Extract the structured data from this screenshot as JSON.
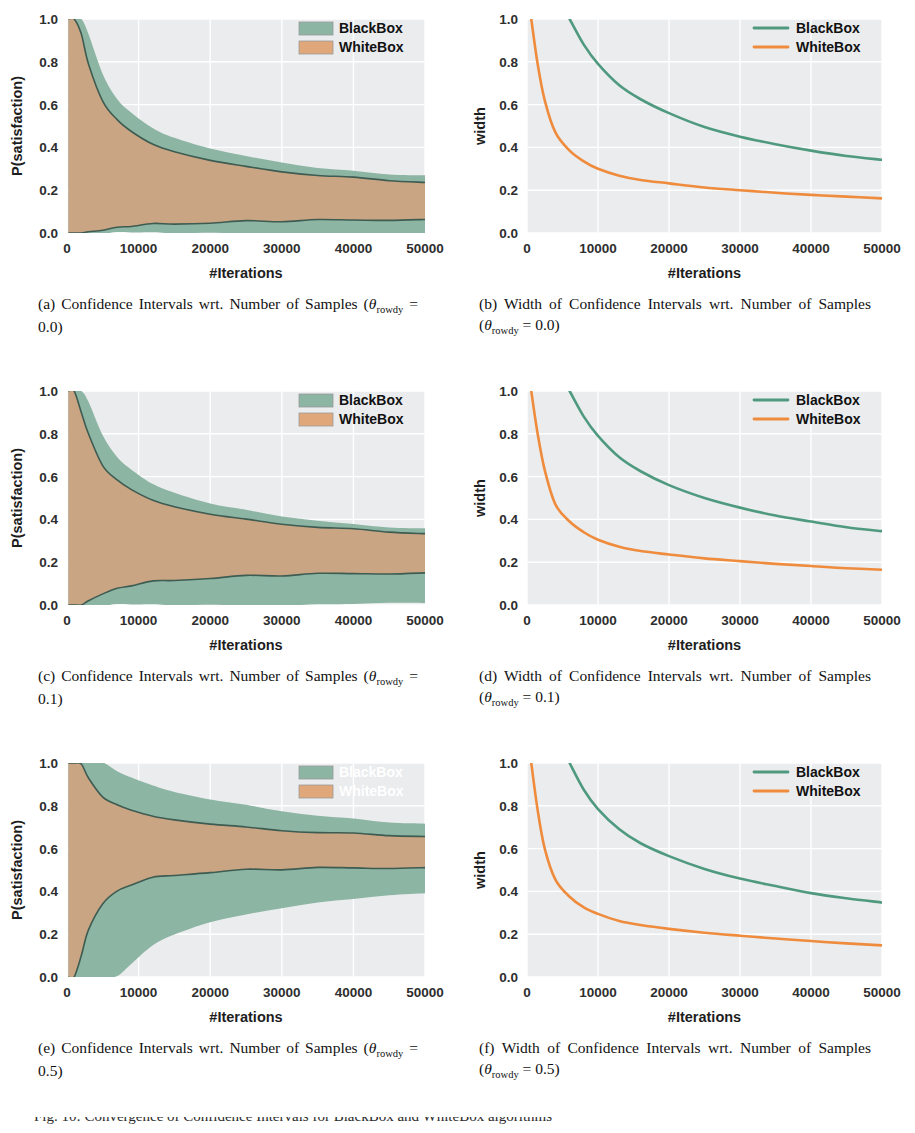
{
  "figure": {
    "panel_count": 6,
    "bottom_cut_text": "Fig. 10: Convergence of Confidence Intervals for BlackBox and WhiteBox algorithms"
  },
  "series_colors": {
    "blackbox_fill": "#8cb5a3",
    "blackbox_line": "#4f9a7f",
    "whitebox_fill": "#e0a87a",
    "whitebox_line": "#ef8b3c",
    "overlap_fill": "#c9a583",
    "edge_line": "#3e5c52",
    "plot_bg": "#eaecee",
    "grid": "#ffffff"
  },
  "labels": {
    "blackbox": "BlackBox",
    "whitebox": "WhiteBox",
    "xlabel": "#Iterations",
    "ylabel_left": "P(satisfaction)",
    "ylabel_right": "width",
    "xticks": [
      "0",
      "10000",
      "20000",
      "30000",
      "40000",
      "50000"
    ],
    "yticks": [
      "0.0",
      "0.2",
      "0.4",
      "0.6",
      "0.8",
      "1.0"
    ]
  },
  "captions": {
    "a": {
      "tag": "(a)",
      "text_before": "Confidence Intervals wrt. Number of Samples (",
      "theta": "θ",
      "sub": "rowdy",
      "eq": " = 0.0)"
    },
    "b": {
      "tag": "(b)",
      "text_before": "Width of Confidence Intervals wrt. Number of Samples (",
      "theta": "θ",
      "sub": "rowdy",
      "eq": " = 0.0)"
    },
    "c": {
      "tag": "(c)",
      "text_before": "Confidence Intervals wrt. Number of Samples (",
      "theta": "θ",
      "sub": "rowdy",
      "eq": " = 0.1)"
    },
    "d": {
      "tag": "(d)",
      "text_before": "Width of Confidence Intervals wrt. Number of Samples (",
      "theta": "θ",
      "sub": "rowdy",
      "eq": " = 0.1)"
    },
    "e": {
      "tag": "(e)",
      "text_before": "Confidence Intervals wrt. Number of Samples (",
      "theta": "θ",
      "sub": "rowdy",
      "eq": " = 0.5)"
    },
    "f": {
      "tag": "(f)",
      "text_before": "Width of Confidence Intervals wrt. Number of Samples (",
      "theta": "θ",
      "sub": "rowdy",
      "eq": " = 0.5)"
    }
  },
  "chart_data": [
    {
      "id": "a",
      "type": "area",
      "title": "",
      "xlabel": "#Iterations",
      "ylabel": "P(satisfaction)",
      "xlim": [
        0,
        50000
      ],
      "ylim": [
        0.0,
        1.0
      ],
      "grid": true,
      "legend_position": "upper-right",
      "legend_visible": true,
      "legend_style": "patch",
      "center": 0.145,
      "x": [
        200,
        1000,
        2000,
        3000,
        5000,
        7000,
        9000,
        12000,
        15000,
        20000,
        25000,
        30000,
        35000,
        40000,
        45000,
        50000
      ],
      "series": [
        {
          "name": "BlackBox",
          "upper": [
            1.0,
            1.0,
            1.0,
            0.93,
            0.74,
            0.63,
            0.565,
            0.49,
            0.445,
            0.395,
            0.355,
            0.33,
            0.305,
            0.29,
            0.277,
            0.268
          ],
          "lower": [
            0.0,
            0.0,
            0.0,
            0.0,
            0.0,
            0.0,
            0.0,
            0.0,
            0.0,
            0.0,
            0.0,
            0.0,
            0.0,
            0.0,
            0.0,
            0.0
          ]
        },
        {
          "name": "WhiteBox",
          "upper": [
            1.0,
            1.0,
            0.93,
            0.79,
            0.62,
            0.53,
            0.475,
            0.415,
            0.38,
            0.34,
            0.31,
            0.29,
            0.272,
            0.258,
            0.247,
            0.238
          ],
          "lower": [
            0.0,
            0.0,
            0.0,
            0.006,
            0.016,
            0.026,
            0.033,
            0.04,
            0.045,
            0.05,
            0.054,
            0.057,
            0.059,
            0.061,
            0.063,
            0.064
          ]
        }
      ]
    },
    {
      "id": "b",
      "type": "line",
      "title": "",
      "xlabel": "#Iterations",
      "ylabel": "width",
      "xlim": [
        0,
        50000
      ],
      "ylim": [
        0.0,
        1.0
      ],
      "grid": true,
      "legend_position": "upper-right",
      "legend_visible": true,
      "legend_style": "line",
      "x": [
        600,
        1500,
        2500,
        4000,
        6000,
        8000,
        10000,
        13000,
        16000,
        20000,
        25000,
        30000,
        35000,
        40000,
        45000,
        50000
      ],
      "series": [
        {
          "name": "BlackBox",
          "values": [
            null,
            null,
            null,
            null,
            1.0,
            0.88,
            0.79,
            0.69,
            0.625,
            0.56,
            0.495,
            0.45,
            0.415,
            0.385,
            0.36,
            0.342
          ]
        },
        {
          "name": "WhiteBox",
          "values": [
            1.0,
            0.79,
            0.62,
            0.47,
            0.385,
            0.335,
            0.3,
            0.268,
            0.248,
            0.232,
            0.213,
            0.2,
            0.188,
            0.178,
            0.17,
            0.162
          ]
        }
      ]
    },
    {
      "id": "c",
      "type": "area",
      "title": "",
      "xlabel": "#Iterations",
      "ylabel": "P(satisfaction)",
      "xlim": [
        0,
        50000
      ],
      "ylim": [
        0.0,
        1.0
      ],
      "grid": true,
      "legend_position": "upper-right",
      "legend_visible": true,
      "legend_style": "patch",
      "center": 0.235,
      "x": [
        200,
        1000,
        2000,
        3000,
        5000,
        7000,
        9000,
        12000,
        15000,
        20000,
        25000,
        30000,
        35000,
        40000,
        45000,
        50000
      ],
      "series": [
        {
          "name": "BlackBox",
          "upper": [
            1.0,
            1.0,
            1.0,
            0.95,
            0.79,
            0.695,
            0.635,
            0.565,
            0.525,
            0.475,
            0.44,
            0.415,
            0.395,
            0.378,
            0.366,
            0.357
          ],
          "lower": [
            0.0,
            0.0,
            0.0,
            0.0,
            0.0,
            0.0,
            0.0,
            0.0,
            0.0,
            0.0,
            0.0,
            0.0,
            0.005,
            0.008,
            0.01,
            0.012
          ]
        },
        {
          "name": "WhiteBox",
          "upper": [
            1.0,
            1.0,
            0.9,
            0.8,
            0.655,
            0.585,
            0.54,
            0.49,
            0.46,
            0.425,
            0.4,
            0.382,
            0.366,
            0.353,
            0.343,
            0.335
          ],
          "lower": [
            0.0,
            0.0,
            0.0,
            0.02,
            0.055,
            0.077,
            0.092,
            0.108,
            0.118,
            0.128,
            0.135,
            0.14,
            0.144,
            0.147,
            0.149,
            0.151
          ]
        }
      ]
    },
    {
      "id": "d",
      "type": "line",
      "title": "",
      "xlabel": "#Iterations",
      "ylabel": "width",
      "xlim": [
        0,
        50000
      ],
      "ylim": [
        0.0,
        1.0
      ],
      "grid": true,
      "legend_position": "upper-right",
      "legend_visible": true,
      "legend_style": "line",
      "x": [
        600,
        1500,
        2500,
        4000,
        6000,
        8000,
        10000,
        13000,
        16000,
        20000,
        25000,
        30000,
        35000,
        40000,
        45000,
        50000
      ],
      "series": [
        {
          "name": "BlackBox",
          "values": [
            null,
            null,
            null,
            null,
            1.0,
            0.88,
            0.79,
            0.69,
            0.625,
            0.56,
            0.5,
            0.455,
            0.418,
            0.39,
            0.363,
            0.345
          ]
        },
        {
          "name": "WhiteBox",
          "values": [
            1.0,
            0.8,
            0.63,
            0.47,
            0.39,
            0.34,
            0.305,
            0.272,
            0.252,
            0.236,
            0.218,
            0.205,
            0.192,
            0.182,
            0.172,
            0.165
          ]
        }
      ]
    },
    {
      "id": "e",
      "type": "area",
      "title": "",
      "xlabel": "#Iterations",
      "ylabel": "P(satisfaction)",
      "xlim": [
        0,
        50000
      ],
      "ylim": [
        0.0,
        1.0
      ],
      "grid": true,
      "legend_position": "upper-right",
      "legend_visible": true,
      "legend_style": "patch",
      "legend_labels_rendered": false,
      "center": 0.58,
      "x": [
        200,
        1000,
        2000,
        3000,
        5000,
        7000,
        9000,
        12000,
        15000,
        20000,
        25000,
        30000,
        35000,
        40000,
        45000,
        50000
      ],
      "series": [
        {
          "name": "BlackBox",
          "upper": [
            1.0,
            1.0,
            1.0,
            1.0,
            1.0,
            0.965,
            0.935,
            0.895,
            0.865,
            0.83,
            0.8,
            0.775,
            0.755,
            0.74,
            0.725,
            0.715
          ],
          "lower": [
            0.0,
            0.0,
            0.0,
            0.0,
            0.0,
            0.0,
            0.06,
            0.145,
            0.2,
            0.255,
            0.295,
            0.325,
            0.35,
            0.368,
            0.382,
            0.395
          ]
        },
        {
          "name": "WhiteBox",
          "upper": [
            1.0,
            1.0,
            0.995,
            0.93,
            0.845,
            0.805,
            0.78,
            0.752,
            0.735,
            0.715,
            0.7,
            0.688,
            0.678,
            0.67,
            0.663,
            0.658
          ],
          "lower": [
            0.0,
            0.0,
            0.1,
            0.22,
            0.345,
            0.4,
            0.432,
            0.462,
            0.478,
            0.492,
            0.5,
            0.505,
            0.508,
            0.51,
            0.511,
            0.512
          ]
        }
      ]
    },
    {
      "id": "f",
      "type": "line",
      "title": "",
      "xlabel": "#Iterations",
      "ylabel": "width",
      "xlim": [
        0,
        50000
      ],
      "ylim": [
        0.0,
        1.0
      ],
      "grid": true,
      "legend_position": "upper-right",
      "legend_visible": true,
      "legend_style": "line",
      "x": [
        600,
        1500,
        2500,
        4000,
        6000,
        8000,
        10000,
        13000,
        16000,
        20000,
        25000,
        30000,
        35000,
        40000,
        45000,
        50000
      ],
      "series": [
        {
          "name": "BlackBox",
          "values": [
            null,
            null,
            null,
            null,
            1.0,
            0.875,
            0.785,
            0.69,
            0.625,
            0.565,
            0.505,
            0.46,
            0.425,
            0.392,
            0.368,
            0.348
          ]
        },
        {
          "name": "WhiteBox",
          "values": [
            1.0,
            0.78,
            0.6,
            0.455,
            0.375,
            0.325,
            0.295,
            0.262,
            0.243,
            0.225,
            0.207,
            0.193,
            0.18,
            0.168,
            0.157,
            0.148
          ]
        }
      ]
    }
  ]
}
